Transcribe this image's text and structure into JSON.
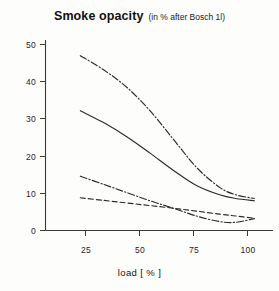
{
  "chart_data": {
    "type": "line",
    "title": "Smoke opacity",
    "subtitle": "(in % after Bosch 1l)",
    "xlabel": "load  [ % ]",
    "ylabel": "",
    "xlim": [
      10,
      108
    ],
    "ylim": [
      0,
      53
    ],
    "xticks": [
      25,
      50,
      75,
      100
    ],
    "yticks": [
      0,
      10,
      20,
      30,
      40,
      50
    ],
    "xtick_labels": [
      "25",
      "50",
      "75",
      "100"
    ],
    "ytick_labels": [
      "0",
      "10",
      "20",
      "30",
      "40",
      "50"
    ],
    "grid": false,
    "legend": "none",
    "series": [
      {
        "name": "upper-dash-dot",
        "style": "dashdot",
        "x": [
          25,
          35,
          45,
          55,
          65,
          75,
          85,
          92,
          100
        ],
        "values": [
          47.0,
          43.2,
          38.5,
          32.2,
          24.6,
          17.0,
          11.6,
          9.6,
          8.6
        ]
      },
      {
        "name": "upper-solid",
        "style": "solid",
        "x": [
          25,
          35,
          45,
          55,
          65,
          75,
          85,
          92,
          100
        ],
        "values": [
          32.2,
          29.0,
          25.2,
          20.8,
          16.2,
          12.1,
          9.6,
          8.6,
          8.0
        ]
      },
      {
        "name": "lower-dash-dot",
        "style": "dashdot",
        "x": [
          25,
          35,
          45,
          55,
          65,
          75,
          85,
          92,
          100
        ],
        "values": [
          14.6,
          12.4,
          10.2,
          8.0,
          6.0,
          3.9,
          2.4,
          2.2,
          3.2
        ]
      },
      {
        "name": "lower-dashed",
        "style": "dashed",
        "x": [
          25,
          35,
          45,
          55,
          65,
          75,
          85,
          92,
          100
        ],
        "values": [
          8.8,
          8.1,
          7.4,
          6.7,
          6.0,
          5.2,
          4.4,
          3.9,
          3.3
        ]
      }
    ]
  },
  "colors": {
    "ink": "#2b2b2b",
    "axis": "#3a3a3a",
    "background": "#fdfdfc"
  }
}
